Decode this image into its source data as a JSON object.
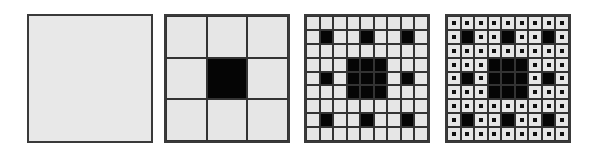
{
  "figure": {
    "colors": {
      "fill": "#e6e6e6",
      "removed": "#050505",
      "line": "#333333"
    },
    "panels": [
      {
        "id": "iteration-0",
        "grid": 1,
        "black_cells": [],
        "dots": false
      },
      {
        "id": "iteration-1",
        "grid": 3,
        "black_cells": [
          [
            1,
            1
          ]
        ],
        "dots": false
      },
      {
        "id": "iteration-2",
        "grid": 9,
        "black_cells": "center 3x3 block + centers of 8 surrounding 3x3 blocks",
        "dots": false
      },
      {
        "id": "iteration-3",
        "grid": 9,
        "black_cells": "same as iteration-2",
        "dots": true
      }
    ]
  }
}
